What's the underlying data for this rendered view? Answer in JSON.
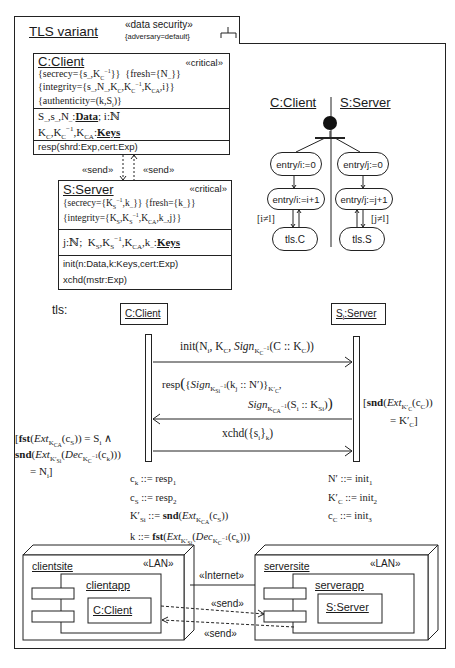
{
  "frame": {
    "title": "TLS variant",
    "stereotype": "«data security»",
    "tag": "{adversary=default}"
  },
  "client_class": {
    "name": "C:Client",
    "stereotype": "«critical»",
    "constraints": [
      "{secrecy={s_,K_C^-1}}",
      "{fresh={N_}}",
      "{integrity={s_,N_,K_C,K_C^-1,K_CA,i}}",
      "{authenticity=(k,S_i)}"
    ],
    "attributes": [
      "S_,s_,N_: Data; i:ℕ",
      "K_C,K_C^-1,K_CA: Keys"
    ],
    "operations": [
      "resp(shrd:Exp,cert:Exp)"
    ]
  },
  "send_labels": {
    "left": "«send»",
    "right": "«send»"
  },
  "server_class": {
    "name": "S:Server",
    "stereotype": "«critical»",
    "constraints": [
      "{secrecy={K_S^-1,k_}}",
      "{fresh={k_}}",
      "{integrity={K_S,K_S^-1,K_CA,k_,j}}"
    ],
    "attributes": [
      "j:ℕ; K_S,K_S^-1,K_CA,k_: Keys"
    ],
    "operations": [
      "init(n:Data,k:Keys,cert:Exp)",
      "xchd(mstr:Exp)"
    ]
  },
  "state_machine": {
    "left_title": "C:Client",
    "right_title": "S:Server",
    "left_states": [
      "entry/i:=0",
      "entry/i:=i+1",
      "tls.C"
    ],
    "right_states": [
      "entry/j:=0",
      "entry/j:=j+1",
      "tls.S"
    ],
    "left_guard": "[i≠l]",
    "right_guard": "[j≠l]"
  },
  "sequence": {
    "label": "tls:",
    "lifeline_left": "C:Client",
    "lifeline_right": "S_i:Server",
    "messages": [
      "init(N_i, K_C, Sign_{K_C^-1}(C::K_C))",
      "resp({Sign_{K_Si^-1}(k_j::N')}_{K'_C}, Sign_{K_CA^-1}(S_i::K_Si))",
      "xchd({s_i}_k)"
    ],
    "guard_right": [
      "[snd(Ext_{K'_C}(c_C))",
      "= K'_C]"
    ],
    "guard_left": [
      "[fst(Ext_{K_CA}(c_S)) = S_i ∧",
      "snd(Ext_{K'_Si}(Dec_{K_C^-1}(c_k)))",
      "= N_i]"
    ],
    "left_defs": [
      "c_k ::= resp_1",
      "c_S ::= resp_2",
      "K'_Si ::= snd(Ext_{K_CA}(c_S))",
      "k ::= fst(Ext_{K'_Si}(Dec_{K_C^-1}(c_k)))"
    ],
    "right_defs": [
      "N' ::= init_1",
      "K'_C ::= init_2",
      "c_C ::= init_3"
    ]
  },
  "deployment": {
    "client_node": "clientsite",
    "client_stereo": "«LAN»",
    "client_component": "clientapp",
    "client_object": "C:Client",
    "server_node": "serversite",
    "server_stereo": "«LAN»",
    "server_component": "serverapp",
    "server_object": "S:Server",
    "link_label": "«Internet»",
    "send_top": "«send»",
    "send_bottom": "«send»"
  }
}
